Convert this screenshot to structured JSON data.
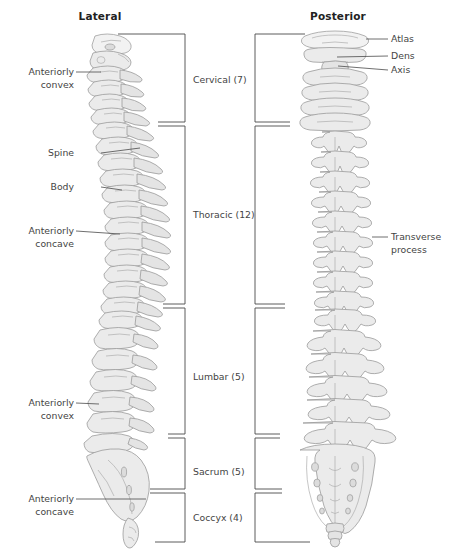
{
  "figure": {
    "type": "anatomical-diagram",
    "views": [
      {
        "id": "lateral",
        "title": "Lateral"
      },
      {
        "id": "posterior",
        "title": "Posterior"
      }
    ]
  },
  "titles": {
    "lateral": "Lateral",
    "posterior": "Posterior"
  },
  "segments": [
    {
      "id": "cervical",
      "label": "Cervical (7)",
      "count": 7,
      "region": "Cervical"
    },
    {
      "id": "thoracic",
      "label": "Thoracic (12)",
      "count": 12,
      "region": "Thoracic"
    },
    {
      "id": "lumbar",
      "label": "Lumbar (5)",
      "count": 5,
      "region": "Lumbar"
    },
    {
      "id": "sacrum",
      "label": "Sacrum (5)",
      "count": 5,
      "region": "Sacrum"
    },
    {
      "id": "coccyx",
      "label": "Coccyx (4)",
      "count": 4,
      "region": "Coccyx"
    }
  ],
  "callouts": {
    "left": [
      {
        "id": "cervical-curve",
        "line1": "Anteriorly",
        "line2": "convex"
      },
      {
        "id": "spine-process",
        "line1": "Spine",
        "line2": ""
      },
      {
        "id": "vertebral-body",
        "line1": "Body",
        "line2": ""
      },
      {
        "id": "thoracic-curve",
        "line1": "Anteriorly",
        "line2": "concave"
      },
      {
        "id": "lumbar-curve",
        "line1": "Anteriorly",
        "line2": "convex"
      },
      {
        "id": "sacral-curve",
        "line1": "Anteriorly",
        "line2": "concave"
      }
    ],
    "right": [
      {
        "id": "atlas",
        "line1": "Atlas",
        "line2": ""
      },
      {
        "id": "dens",
        "line1": "Dens",
        "line2": ""
      },
      {
        "id": "axis",
        "line1": "Axis",
        "line2": ""
      },
      {
        "id": "transverse",
        "line1": "Transverse",
        "line2": "process"
      }
    ]
  },
  "colors": {
    "bone_fill": "#ebebeb",
    "bone_fill_alt": "#e4e4e4",
    "bone_stroke": "#9a9a9a",
    "text": "#3a3a3a",
    "rule": "#4a4a4a",
    "background": "#ffffff"
  }
}
